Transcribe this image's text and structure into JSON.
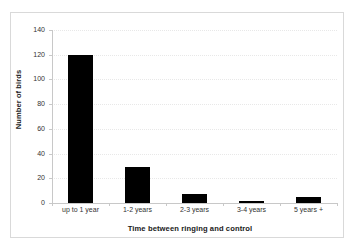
{
  "chart_data": {
    "type": "bar",
    "title": "",
    "categories": [
      "up to 1 year",
      "1-2 years",
      "2-3 years",
      "3-4 years",
      "5 years +"
    ],
    "values": [
      120,
      29,
      7,
      1,
      5
    ],
    "xlabel": "Time between ringing and control",
    "ylabel": "Number of birds",
    "ylim": [
      0,
      140
    ],
    "yticks": [
      0,
      20,
      40,
      60,
      80,
      100,
      120,
      140
    ],
    "ytick_labels": [
      "0",
      "20",
      "40",
      "60",
      "80",
      "100",
      "120",
      "140"
    ],
    "grid": "horizontal-dotted",
    "legend": "none",
    "bar_color": "#000000",
    "grid_color": "#e8e8e8",
    "axis_color": "#c8c8c8",
    "frame_color": "#d9d9d9",
    "background": "#ffffff"
  }
}
